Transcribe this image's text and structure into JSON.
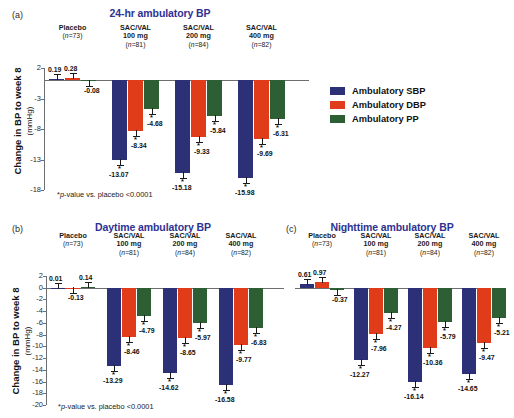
{
  "legend": {
    "items": [
      {
        "key": "sbp",
        "label": "Ambulatory SBP",
        "color": "#2c3077"
      },
      {
        "key": "dbp",
        "label": "Ambulatory DBP",
        "color": "#e03c19"
      },
      {
        "key": "pp",
        "label": "Ambulatory PP",
        "color": "#2e5e33"
      }
    ]
  },
  "footnote": "*p-value vs. placebo <0.0001",
  "axis": {
    "ylabel_main": "Change in BP to week 8",
    "ylabel_unit": "(mmHg)"
  },
  "groups": [
    {
      "name": "Placebo",
      "line2": "",
      "n": "(n=73)"
    },
    {
      "name": "SAC/VAL",
      "line2": "100 mg",
      "n": "(n=81)"
    },
    {
      "name": "SAC/VAL",
      "line2": "200 mg",
      "n": "(n=84)"
    },
    {
      "name": "SAC/VAL",
      "line2": "400 mg",
      "n": "(n=82)"
    }
  ],
  "chart_data": [
    {
      "panel": "a",
      "type": "bar",
      "title": "24-hr ambulatory BP",
      "xlabel": "",
      "ylabel": "Change in BP to week 8 (mmHg)",
      "ylim": [
        -18,
        2
      ],
      "yticks": [
        2,
        -3,
        -8,
        -13,
        -18
      ],
      "grid": false,
      "legend_position": "right",
      "categories": [
        "Placebo (n=73)",
        "SAC/VAL 100 mg (n=81)",
        "SAC/VAL 200 mg (n=84)",
        "SAC/VAL 400 mg (n=82)"
      ],
      "series": [
        {
          "name": "Ambulatory SBP",
          "color": "#2c3077",
          "values": [
            0.19,
            -13.07,
            -15.18,
            -15.98
          ],
          "significant": [
            false,
            true,
            true,
            true
          ]
        },
        {
          "name": "Ambulatory DBP",
          "color": "#e03c19",
          "values": [
            0.28,
            -8.34,
            -9.33,
            -9.69
          ],
          "significant": [
            false,
            true,
            true,
            true
          ]
        },
        {
          "name": "Ambulatory PP",
          "color": "#2e5e33",
          "values": [
            -0.08,
            -4.68,
            -5.84,
            -6.31
          ],
          "significant": [
            false,
            true,
            true,
            true
          ]
        }
      ]
    },
    {
      "panel": "b",
      "type": "bar",
      "title": "Daytime ambulatory BP",
      "xlabel": "",
      "ylabel": "Change in BP to week 8 (mmHg)",
      "ylim": [
        -20,
        2
      ],
      "yticks": [
        2,
        0,
        -2,
        -4,
        -6,
        -8,
        -10,
        -12,
        -14,
        -16,
        -18,
        -20
      ],
      "grid": false,
      "legend_position": "none",
      "categories": [
        "Placebo (n=73)",
        "SAC/VAL 100 mg (n=81)",
        "SAC/VAL 200 mg (n=84)",
        "SAC/VAL 400 mg (n=82)"
      ],
      "series": [
        {
          "name": "Ambulatory SBP",
          "color": "#2c3077",
          "values": [
            0.01,
            -13.29,
            -14.62,
            -16.58
          ],
          "significant": [
            false,
            true,
            true,
            true
          ]
        },
        {
          "name": "Ambulatory DBP",
          "color": "#e03c19",
          "values": [
            -0.13,
            -8.46,
            -8.65,
            -9.77
          ],
          "significant": [
            false,
            true,
            true,
            true
          ]
        },
        {
          "name": "Ambulatory PP",
          "color": "#2e5e33",
          "values": [
            0.14,
            -4.79,
            -5.97,
            -6.83
          ],
          "significant": [
            false,
            true,
            true,
            true
          ]
        }
      ]
    },
    {
      "panel": "c",
      "type": "bar",
      "title": "Nighttime ambulatory BP",
      "xlabel": "",
      "ylabel": "",
      "ylim": [
        -20,
        2
      ],
      "yticks": [],
      "grid": false,
      "legend_position": "none",
      "categories": [
        "Placebo (n=73)",
        "SAC/VAL 100 mg (n=81)",
        "SAC/VAL 200 mg (n=84)",
        "SAC/VAL 400 mg (n=82)"
      ],
      "series": [
        {
          "name": "Ambulatory SBP",
          "color": "#2c3077",
          "values": [
            0.61,
            -12.27,
            -16.14,
            -14.65
          ],
          "significant": [
            false,
            true,
            true,
            true
          ]
        },
        {
          "name": "Ambulatory DBP",
          "color": "#e03c19",
          "values": [
            0.97,
            -7.96,
            -10.36,
            -9.47
          ],
          "significant": [
            false,
            true,
            true,
            true
          ]
        },
        {
          "name": "Ambulatory PP",
          "color": "#2e5e33",
          "values": [
            -0.37,
            -4.27,
            -5.79,
            -5.21
          ],
          "significant": [
            false,
            true,
            true,
            true
          ]
        }
      ]
    }
  ],
  "panel_letters": {
    "a": "(a)",
    "b": "(b)",
    "c": "(c)"
  }
}
